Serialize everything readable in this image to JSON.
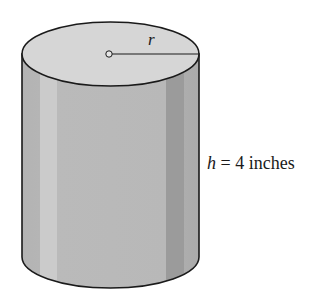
{
  "figure": {
    "type": "cylinder",
    "radius_label": "r",
    "height_label": {
      "variable": "h",
      "equals": " = ",
      "value": "4 inches"
    }
  },
  "colors": {
    "top_face": "#d6d6d6",
    "side_base": "#b9b9b9",
    "side_highlight": "#cdcdcd",
    "side_shadow": "#9a9a9a",
    "side_right": "#adadad",
    "outline": "#1a1a1a"
  }
}
